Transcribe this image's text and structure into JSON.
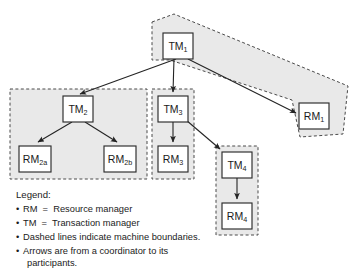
{
  "diagram": {
    "colors": {
      "machine_fill": "#e9e9e9",
      "machine_border": "#4a4a4a",
      "node_fill": "#ffffff",
      "node_border": "#2b2b2b",
      "edge": "#242424",
      "text": "#1a1a1a",
      "background": "#ffffff"
    },
    "nodes": [
      {
        "id": "tm1",
        "base": "TM",
        "sub": "1",
        "label": "TM1",
        "type": "transaction-manager",
        "x": 163,
        "y": 33,
        "w": 30,
        "h": 26
      },
      {
        "id": "tm2",
        "base": "TM",
        "sub": "2",
        "label": "TM2",
        "type": "transaction-manager",
        "x": 63,
        "y": 96,
        "w": 30,
        "h": 26
      },
      {
        "id": "tm3",
        "base": "TM",
        "sub": "3",
        "label": "TM3",
        "type": "transaction-manager",
        "x": 158,
        "y": 96,
        "w": 30,
        "h": 26
      },
      {
        "id": "tm4",
        "base": "TM",
        "sub": "4",
        "label": "TM4",
        "type": "transaction-manager",
        "x": 222,
        "y": 152,
        "w": 30,
        "h": 26
      },
      {
        "id": "rm1",
        "base": "RM",
        "sub": "1",
        "label": "RM1",
        "type": "resource-manager",
        "x": 299,
        "y": 103,
        "w": 30,
        "h": 26
      },
      {
        "id": "rm2a",
        "base": "RM",
        "sub": "2a",
        "label": "RM2a",
        "type": "resource-manager",
        "x": 19,
        "y": 146,
        "w": 32,
        "h": 26
      },
      {
        "id": "rm2b",
        "base": "RM",
        "sub": "2b",
        "label": "RM2b",
        "type": "resource-manager",
        "x": 104,
        "y": 146,
        "w": 32,
        "h": 26
      },
      {
        "id": "rm3",
        "base": "RM",
        "sub": "3",
        "label": "RM3",
        "type": "resource-manager",
        "x": 158,
        "y": 146,
        "w": 30,
        "h": 26
      },
      {
        "id": "rm4",
        "base": "RM",
        "sub": "4",
        "label": "RM4",
        "type": "resource-manager",
        "x": 222,
        "y": 203,
        "w": 30,
        "h": 26
      }
    ],
    "edges": [
      {
        "id": "e-tm1-tm2",
        "from": "tm1",
        "to": "tm2",
        "points": "176,59 80,94"
      },
      {
        "id": "e-tm1-tm3",
        "from": "tm1",
        "to": "tm3",
        "points": "174,59 173,92"
      },
      {
        "id": "e-tm1-rm1",
        "from": "tm1",
        "to": "rm1",
        "points": "188,59 296,113"
      },
      {
        "id": "e-tm2-rm2a",
        "from": "tm2",
        "to": "rm2a",
        "points": "72,122 38,142"
      },
      {
        "id": "e-tm2-rm2b",
        "from": "tm2",
        "to": "rm2b",
        "points": "85,122 117,142"
      },
      {
        "id": "e-tm3-rm3",
        "from": "tm3",
        "to": "rm3",
        "points": "173,122 173,142"
      },
      {
        "id": "e-tm3-tm4",
        "from": "tm3",
        "to": "tm4",
        "points": "186,120 221,150"
      },
      {
        "id": "e-tm4-rm4",
        "from": "tm4",
        "to": "rm4",
        "points": "237,178 237,199"
      }
    ],
    "machine_boundaries": [
      {
        "id": "boundary-machine-1",
        "shape": "polygon",
        "contains": [
          "tm1",
          "rm1"
        ],
        "points": "152,22 174,14 348,86 343,134 300,137 292,100 170,60 152,60"
      },
      {
        "id": "boundary-machine-2",
        "shape": "rect",
        "contains": [
          "tm2",
          "rm2a",
          "rm2b"
        ],
        "x": 10,
        "y": 89,
        "w": 137,
        "h": 90
      },
      {
        "id": "boundary-machine-3",
        "shape": "rect",
        "contains": [
          "tm3",
          "rm3"
        ],
        "x": 152,
        "y": 89,
        "w": 42,
        "h": 90
      },
      {
        "id": "boundary-machine-4",
        "shape": "rect",
        "contains": [
          "tm4",
          "rm4"
        ],
        "x": 216,
        "y": 146,
        "w": 42,
        "h": 89
      }
    ]
  },
  "legend": {
    "title": "Legend:",
    "bullet": "•",
    "items": [
      "RM  =  Resource manager",
      "TM  =  Transaction manager",
      "Dashed lines indicate machine boundaries.",
      "Arrows are from a coordinator to its"
    ],
    "continuation": "participants."
  }
}
